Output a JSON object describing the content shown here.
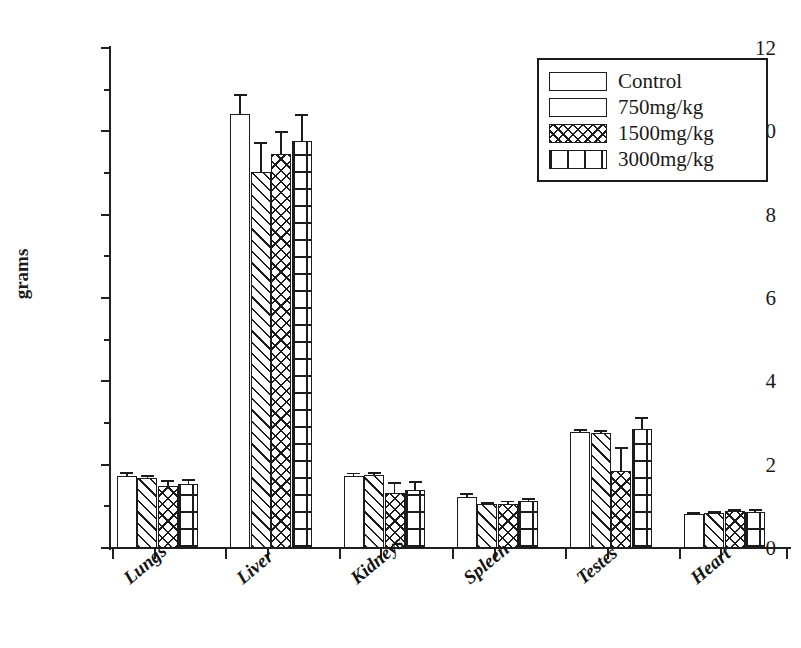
{
  "chart_data": {
    "type": "bar",
    "title": "",
    "xlabel": "",
    "ylabel": "grams",
    "ylim": [
      0,
      12
    ],
    "ytick_step": 2,
    "yticks": [
      0,
      2,
      4,
      6,
      8,
      10,
      12
    ],
    "ytick_labels": [
      "0",
      "2",
      "4",
      "6",
      "8",
      "10",
      "12"
    ],
    "yminor_ticks": [
      1,
      3,
      5,
      7,
      9,
      11
    ],
    "grid": false,
    "legend_position": "top-right",
    "categories": [
      "Lungs",
      "Liver",
      "Kidneys",
      "Spleen",
      "Testes",
      "Heart"
    ],
    "series": [
      {
        "name": "Control",
        "pattern": "blank",
        "values": [
          1.72,
          10.42,
          1.72,
          1.22,
          2.78,
          0.82
        ],
        "errors": [
          0.09,
          0.45,
          0.07,
          0.07,
          0.06,
          0.03
        ]
      },
      {
        "name": "750mg/kg",
        "pattern": "diagonal-hatch",
        "values": [
          1.68,
          9.02,
          1.75,
          1.05,
          2.76,
          0.83
        ],
        "errors": [
          0.05,
          0.7,
          0.05,
          0.04,
          0.05,
          0.03
        ]
      },
      {
        "name": "1500mg/kg",
        "pattern": "cross-hatch",
        "values": [
          1.5,
          9.45,
          1.32,
          1.06,
          1.86,
          0.88
        ],
        "errors": [
          0.12,
          0.53,
          0.24,
          0.06,
          0.55,
          0.04
        ]
      },
      {
        "name": "3000mg/kg",
        "pattern": "line-grid",
        "values": [
          1.53,
          9.78,
          1.4,
          1.12,
          2.85,
          0.87
        ],
        "errors": [
          0.1,
          0.62,
          0.18,
          0.06,
          0.28,
          0.04
        ]
      }
    ]
  },
  "legend": {
    "entries": [
      {
        "label": "Control",
        "pattern": "blank"
      },
      {
        "label": "750mg/kg",
        "pattern": "diagonal-hatch"
      },
      {
        "label": "1500mg/kg",
        "pattern": "cross-hatch"
      },
      {
        "label": "3000mg/kg",
        "pattern": "line-grid"
      }
    ]
  },
  "colors": {
    "ink": "#1c1c1c",
    "background": "#ffffff"
  }
}
